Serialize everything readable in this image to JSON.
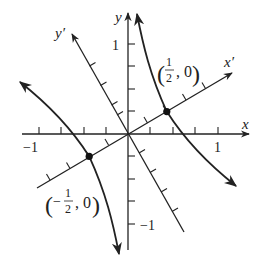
{
  "figure": {
    "axes": {
      "x_label": "x",
      "y_label": "y",
      "x_prime_label": "x′",
      "y_prime_label": "y′",
      "x_tick_labels": {
        "neg": "−1",
        "pos": "1"
      },
      "y_tick_labels": {
        "pos": "1",
        "neg": "−1"
      },
      "tick_spacing": 0.25,
      "rotation_degrees": 30
    },
    "points": [
      {
        "name": "vertex-right",
        "label_open": "(",
        "label_num": "1",
        "label_den": "2",
        "label_rest": ", 0)",
        "sign": ""
      },
      {
        "name": "vertex-left",
        "label_open": "(",
        "label_num": "1",
        "label_den": "2",
        "label_rest": ", 0)",
        "sign": "−"
      }
    ],
    "colors": {
      "ink": "#222222",
      "background": "#ffffff"
    }
  }
}
